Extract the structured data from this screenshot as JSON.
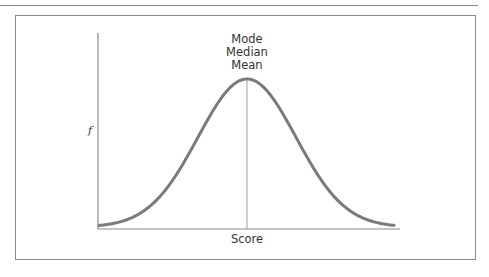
{
  "figure": {
    "stat_labels": [
      "Mode",
      "Median",
      "Mean"
    ],
    "y_axis_label": "f",
    "x_axis_label": "Score",
    "colors": {
      "curve": "#7a7a7a",
      "axes": "#8a8a8a",
      "center_line": "#a0a0a0",
      "frame": "#8a8a8a"
    }
  },
  "chart_data": {
    "type": "line",
    "title": "",
    "xlabel": "Score",
    "ylabel": "f",
    "annotations": [
      "Mode",
      "Median",
      "Mean"
    ],
    "grid": false,
    "series": [
      {
        "name": "normal curve",
        "x": [
          -3,
          -2.5,
          -2,
          -1.5,
          -1,
          -0.5,
          0,
          0.5,
          1,
          1.5,
          2,
          2.5,
          3
        ],
        "values": [
          0.004,
          0.018,
          0.054,
          0.13,
          0.242,
          0.352,
          0.399,
          0.352,
          0.242,
          0.13,
          0.054,
          0.018,
          0.004
        ]
      }
    ]
  }
}
